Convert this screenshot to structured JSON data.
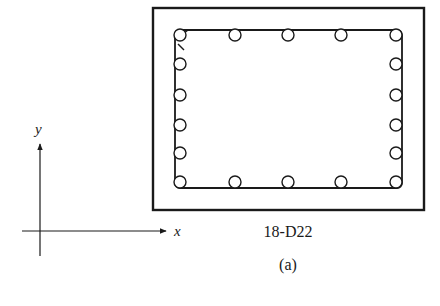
{
  "figure": {
    "label": "(a)",
    "rebar_label": "18-D22",
    "colors": {
      "line": "#1a1a1a",
      "background": "#ffffff"
    }
  },
  "axes": {
    "x_label": "x",
    "y_label": "y",
    "origin": [
      40,
      231
    ],
    "x_end": [
      166,
      231
    ],
    "y_end": [
      40,
      144
    ]
  },
  "section": {
    "outer": {
      "x": 153,
      "y": 8,
      "width": 271,
      "height": 202,
      "stroke_width": 2.4
    },
    "stirrup": {
      "x": 175,
      "y": 30,
      "width": 227,
      "height": 158,
      "rx": 5,
      "stroke_width": 1.8
    },
    "bar_radius": 6,
    "bars": {
      "top": [
        [
          180,
          35
        ],
        [
          235,
          35
        ],
        [
          288,
          35
        ],
        [
          341,
          35
        ],
        [
          396,
          35
        ]
      ],
      "bottom": [
        [
          180,
          182
        ],
        [
          235,
          182
        ],
        [
          288,
          182
        ],
        [
          341,
          182
        ],
        [
          396,
          182
        ]
      ],
      "left": [
        [
          180,
          64
        ],
        [
          180,
          95
        ],
        [
          180,
          125
        ],
        [
          180,
          153
        ]
      ],
      "right": [
        [
          396,
          64
        ],
        [
          396,
          95
        ],
        [
          396,
          125
        ],
        [
          396,
          153
        ]
      ]
    },
    "bar_count": 18
  }
}
